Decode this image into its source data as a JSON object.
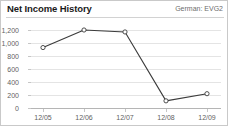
{
  "header": {
    "title": "Net Income History",
    "ticker": "German: EVG2"
  },
  "chart_data": {
    "type": "line",
    "title": "Net Income History",
    "subtitle": "German: EVG2",
    "xlabel": "",
    "ylabel": "",
    "categories": [
      "12/05",
      "12/06",
      "12/07",
      "12/08",
      "12/09"
    ],
    "values": [
      930,
      1200,
      1170,
      110,
      220
    ],
    "series": [
      {
        "name": "Net Income",
        "values": [
          930,
          1200,
          1170,
          110,
          220
        ]
      }
    ],
    "ylim": [
      0,
      1200
    ],
    "yticks": [
      0,
      200,
      400,
      600,
      800,
      1000,
      1200
    ],
    "ytick_labels": [
      "0",
      "200",
      "400",
      "600",
      "800",
      "1,000",
      "1,200"
    ],
    "grid": true,
    "legend": false,
    "legend_position": "none",
    "line_color": "#3b3b3b",
    "marker": "open-circle",
    "marker_fill": "#ffffff",
    "grid_color": "#e4e4e4",
    "axis_color": "#b5b5b5",
    "text_color": "#5f5f5f"
  }
}
